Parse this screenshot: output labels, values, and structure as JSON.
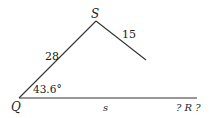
{
  "diagram": {
    "type": "triangle",
    "vertices": {
      "Q": "Q",
      "S": "S",
      "R": "? R ?"
    },
    "sides": {
      "QS": "28",
      "SR": "15",
      "QR": "s"
    },
    "angle_Q": "43.6°"
  }
}
